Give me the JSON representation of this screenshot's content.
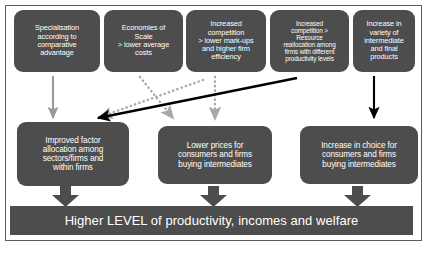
{
  "diagram": {
    "colors": {
      "node_fill": "#4d4d4d",
      "node_text": "#ffffff",
      "frame_border": "#5c5c5c",
      "arrow_black": "#000000",
      "arrow_gray": "#9a9a9a",
      "arrow_dotted": "#a8a8a8",
      "background": "#ffffff"
    },
    "top_nodes": [
      {
        "id": "specialisation",
        "label": "Specialisation\naccording to\ncomparative\nadvantage"
      },
      {
        "id": "economies-of-scale",
        "label": "Economies of\nScale\n> lower average\ncosts"
      },
      {
        "id": "increased-competition-markups",
        "label": "Increased\ncompetition\n> lower mark-ups\nand higher firm\nefficiency"
      },
      {
        "id": "increased-competition-reallocation",
        "label": "Increased\ncompetition >\nResource\nreallocation among\nfirms with different\nproductivity levels"
      },
      {
        "id": "variety-of-products",
        "label": "Increase in\nvariety of\nintermediate\nand final\nproducts"
      }
    ],
    "middle_nodes": [
      {
        "id": "improved-factor-allocation",
        "label": "Improved factor\nallocation among\nsectors/firms and\nwithin firms"
      },
      {
        "id": "lower-prices",
        "label": "Lower prices for\nconsumers and firms\nbuying intermediates"
      },
      {
        "id": "increase-in-choice",
        "label": "Increase in choice for\nconsumers and firms\nbuying intermediates"
      }
    ],
    "banner": {
      "id": "outcome-banner",
      "label": "Higher LEVEL of productivity, incomes and welfare"
    },
    "connectors": [
      {
        "id": "specialisation-to-factor-allocation",
        "style": "solid-gray",
        "from": "specialisation",
        "to": "improved-factor-allocation"
      },
      {
        "id": "economies-of-scale-to-lower-prices",
        "style": "dotted-gray",
        "from": "economies-of-scale",
        "to": "lower-prices"
      },
      {
        "id": "competition-markups-to-factor-allocation",
        "style": "dotted-gray",
        "from": "increased-competition-markups",
        "to": "improved-factor-allocation"
      },
      {
        "id": "competition-markups-to-lower-prices",
        "style": "dotted-gray",
        "from": "increased-competition-markups",
        "to": "lower-prices"
      },
      {
        "id": "reallocation-to-factor-allocation",
        "style": "solid-black",
        "from": "increased-competition-reallocation",
        "to": "improved-factor-allocation"
      },
      {
        "id": "variety-to-increase-in-choice",
        "style": "solid-black",
        "from": "variety-of-products",
        "to": "increase-in-choice"
      },
      {
        "id": "factor-allocation-to-banner",
        "style": "block-arrow",
        "from": "improved-factor-allocation",
        "to": "outcome-banner"
      },
      {
        "id": "lower-prices-to-banner",
        "style": "block-arrow",
        "from": "lower-prices",
        "to": "outcome-banner"
      },
      {
        "id": "increase-in-choice-to-banner",
        "style": "block-arrow",
        "from": "increase-in-choice",
        "to": "outcome-banner"
      }
    ]
  }
}
